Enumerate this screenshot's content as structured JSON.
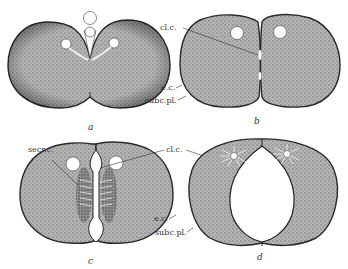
{
  "figure": {
    "panels": [
      {
        "id": "a",
        "label": "a"
      },
      {
        "id": "b",
        "label": "b"
      },
      {
        "id": "c",
        "label": "c"
      },
      {
        "id": "d",
        "label": "d"
      }
    ],
    "annotations": {
      "cleavage_cavity": "cl.c.",
      "ectoderm_cells": "e.c.",
      "subcortical_plasm": "subc.pl.",
      "secretory_cells": "secr.c."
    },
    "colors": {
      "cell_fill": "#a9a9a9",
      "cell_outline": "#2a2a2a",
      "background": "#ffffff"
    }
  }
}
